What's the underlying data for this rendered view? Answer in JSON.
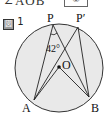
{
  "header": {
    "text": "∠AOB",
    "answer_box": "⑥"
  },
  "figure": {
    "label_icon": "図",
    "label_number": "1",
    "points": {
      "P": "P",
      "P_prime": "P′",
      "A": "A",
      "B": "B",
      "O": "O"
    },
    "angle_label": "42°",
    "colors": {
      "circle_fill": "#e8e8e8",
      "stroke": "#222222"
    }
  }
}
